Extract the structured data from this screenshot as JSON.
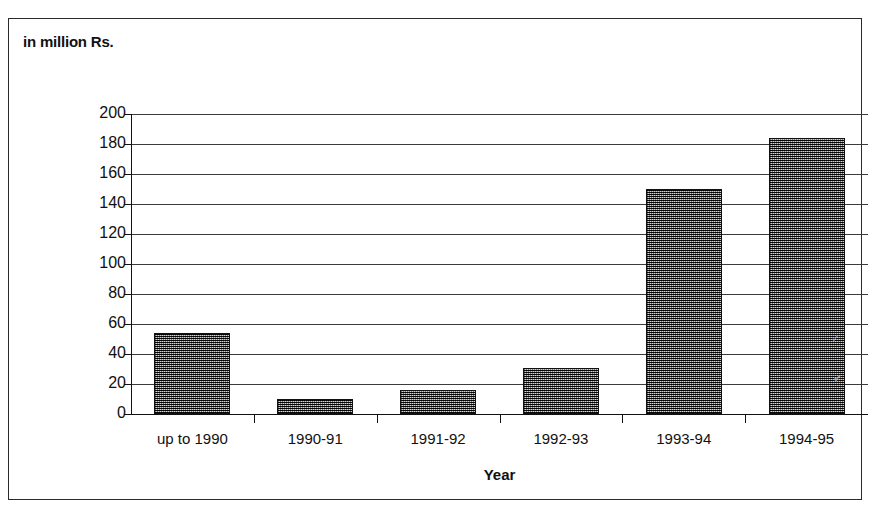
{
  "caption": "in million Rs.",
  "chart_data": {
    "type": "bar",
    "title": "in million Rs.",
    "subtitle": "",
    "xlabel": "Year",
    "ylabel": "",
    "categories": [
      "up to 1990",
      "1990-91",
      "1991-92",
      "1992-93",
      "1993-94",
      "1994-95"
    ],
    "values": [
      54,
      10,
      16,
      31,
      150,
      184
    ],
    "yticks": [
      0,
      20,
      40,
      60,
      80,
      100,
      120,
      140,
      160,
      180,
      200
    ],
    "ytick_labels": [
      "0",
      "20",
      "40",
      "60",
      "80",
      "100",
      "120",
      "140",
      "160",
      "180",
      "200"
    ],
    "ylim": [
      0,
      200
    ],
    "grid": true,
    "legend": false,
    "legend_position": "none",
    "bar_fill": "#6e6e6e",
    "bar_edge": "#111111",
    "axis_color": "#111111"
  },
  "artifacts": [
    "✓",
    "✔"
  ]
}
